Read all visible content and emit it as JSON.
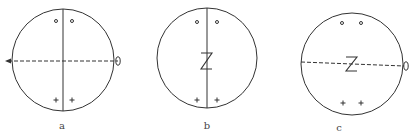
{
  "figure": {
    "panels": [
      {
        "label": "a",
        "center": [
          63,
          60
        ],
        "radius": 51,
        "vertical_line": "solid",
        "horizontal_line": "dashed",
        "arrow_left": true,
        "twofold_ellipse_right": true,
        "center_symbol": "",
        "top_markers": "o o",
        "bottom_markers": "+ +"
      },
      {
        "label": "b",
        "center": [
          207,
          58
        ],
        "radius": 50,
        "vertical_line": "solid",
        "horizontal_line": "none",
        "arrow_left": false,
        "twofold_ellipse_right": false,
        "center_symbol": "Z",
        "top_markers": "o o",
        "bottom_markers": "+ +"
      },
      {
        "label": "c",
        "center": [
          352,
          64
        ],
        "radius": 51,
        "vertical_line": "none",
        "horizontal_line": "dashed",
        "arrow_left": false,
        "twofold_ellipse_right": true,
        "center_symbol": "Z",
        "top_markers": "o o",
        "bottom_markers": "+ +"
      }
    ],
    "colors": {
      "stroke": "#333333",
      "background": "#ffffff"
    }
  }
}
